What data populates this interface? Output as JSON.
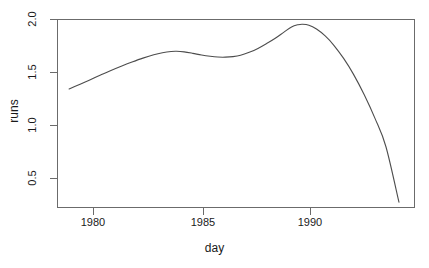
{
  "chart_data": {
    "type": "line",
    "title": "",
    "xlabel": "day",
    "ylabel": "runs",
    "xlim": [
      1978.85,
      1994.2
    ],
    "ylim": [
      0.26,
      2.06
    ],
    "grid": false,
    "legend": null,
    "xticks": [
      1980,
      1985,
      1990
    ],
    "xtick_labels": [
      "1980",
      "1985",
      "1990"
    ],
    "yticks": [
      0.5,
      1.0,
      1.5,
      2.0
    ],
    "ytick_labels": [
      "0.5",
      "1.0",
      "1.5",
      "2.0"
    ],
    "series": [
      {
        "name": "runs",
        "color": "#4d4d4d",
        "x": [
          1978.9,
          1979.35,
          1979.8,
          1980.3,
          1980.8,
          1981.3,
          1981.8,
          1982.3,
          1982.8,
          1983.2,
          1983.6,
          1983.85,
          1984.2,
          1984.6,
          1985.0,
          1985.4,
          1985.75,
          1986.1,
          1986.45,
          1986.8,
          1987.2,
          1987.6,
          1988.0,
          1988.4,
          1988.8,
          1989.15,
          1989.45,
          1989.65,
          1989.95,
          1990.3,
          1990.7,
          1991.1,
          1991.55,
          1992.0,
          1992.5,
          1993.0,
          1993.5,
          1994.1
        ],
        "y": [
          1.34,
          1.38,
          1.42,
          1.468,
          1.512,
          1.554,
          1.594,
          1.631,
          1.663,
          1.682,
          1.694,
          1.696,
          1.69,
          1.676,
          1.66,
          1.648,
          1.641,
          1.64,
          1.645,
          1.658,
          1.686,
          1.722,
          1.768,
          1.818,
          1.876,
          1.925,
          1.946,
          1.951,
          1.942,
          1.905,
          1.84,
          1.752,
          1.628,
          1.48,
          1.285,
          1.06,
          0.795,
          0.272
        ]
      }
    ]
  },
  "axes": {
    "y_label": "runs",
    "x_label": "day",
    "y_tick_labels": [
      "2.0",
      "1.5",
      "1.0",
      "0.5"
    ],
    "x_tick_labels": [
      "1980",
      "1985",
      "1990"
    ]
  }
}
